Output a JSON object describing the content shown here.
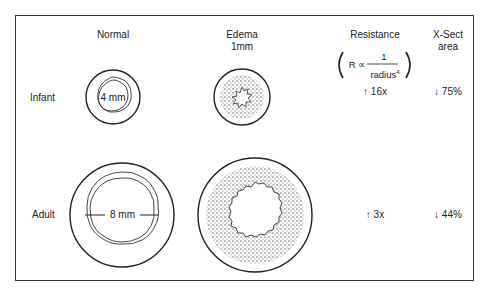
{
  "columns": {
    "normal": "Normal",
    "edema_line1": "Edema",
    "edema_line2": "1mm",
    "resistance": "Resistance",
    "xsect_line1": "X-Sect",
    "xsect_line2": "area"
  },
  "formula": {
    "lhs": "R ∝",
    "numerator": "1",
    "denominator": "radius",
    "exponent": "4"
  },
  "rows": [
    {
      "label": "Infant",
      "diameter": "4 mm",
      "resistance": "↑ 16x",
      "area": "↓ 75%"
    },
    {
      "label": "Adult",
      "diameter": "8 mm",
      "resistance": "↑ 3x",
      "area": "↓ 44%"
    }
  ]
}
